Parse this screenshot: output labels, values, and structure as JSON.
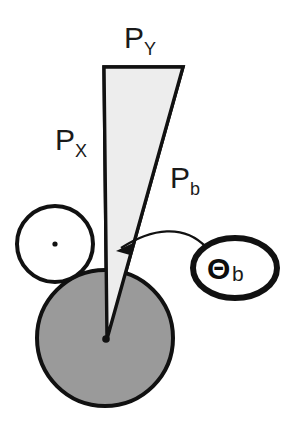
{
  "diagram": {
    "colors": {
      "stroke": "#111111",
      "background": "#ffffff",
      "gray_fill": "#9a9a9a",
      "light_fill": "#ededed",
      "dot": "#111111"
    },
    "labels": {
      "p_y": {
        "base": "P",
        "sub": "Y"
      },
      "p_x": {
        "base": "P",
        "sub": "X"
      },
      "p_b": {
        "base": "P",
        "sub": "b"
      },
      "theta_b": {
        "base": "Θ",
        "sub": "b"
      }
    },
    "shapes": {
      "force_triangle": {
        "name": "force-triangle",
        "fill": "#ededed",
        "points": "104,67 183,67 107,339"
      },
      "right_angle_marker": {
        "name": "right-angle-marker",
        "points": "104,86 123,86 123,67"
      },
      "gray_disc": {
        "name": "gray-disc",
        "cx": 105,
        "cy": 338,
        "r": 68,
        "fill": "#9a9a9a"
      },
      "white_circle": {
        "name": "white-circle",
        "cx": 55,
        "cy": 244,
        "r": 38,
        "fill": "#ffffff"
      },
      "angle_callout_ellipse": {
        "name": "angle-callout-ellipse",
        "cx": 235,
        "cy": 268,
        "rx": 42,
        "ry": 30,
        "fill": "#ffffff"
      },
      "center_dot_gray_disc": {
        "name": "gray-disc-center-dot",
        "cx": 105,
        "cy": 339,
        "r": 3.6
      },
      "center_dot_white_circle": {
        "name": "white-circle-center-dot",
        "cx": 55,
        "cy": 244,
        "r": 2.6
      },
      "callout_arrow": {
        "name": "callout-arrow",
        "path": "M 203,250 C 180,228 150,231 120,249",
        "head": "120,249 134,246 130,257"
      }
    }
  }
}
